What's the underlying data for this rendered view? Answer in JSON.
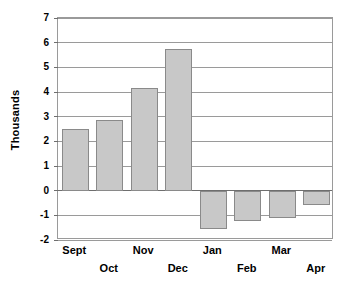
{
  "chart_data": {
    "type": "bar",
    "title": "",
    "xlabel": "",
    "ylabel": "Thousands",
    "categories": [
      "Sept",
      "Oct",
      "Nov",
      "Dec",
      "Jan",
      "Feb",
      "Mar",
      "Apr"
    ],
    "values": [
      2.5,
      2.85,
      4.15,
      5.75,
      -1.55,
      -1.25,
      -1.1,
      -0.6
    ],
    "series": [
      {
        "name": "",
        "values": [
          2.5,
          2.85,
          4.15,
          5.75,
          -1.55,
          -1.25,
          -1.1,
          -0.6
        ]
      }
    ],
    "ylim": [
      -2,
      7
    ],
    "ytick_labels": [
      "7",
      "6",
      "5",
      "4",
      "3",
      "2",
      "1",
      "0",
      "-1",
      "-2"
    ],
    "ytick_values": [
      7,
      6,
      5,
      4,
      3,
      2,
      1,
      0,
      -1,
      -2
    ],
    "grid": true,
    "grid_axis": "y",
    "legend": false,
    "legend_position": "none",
    "bar_fill_color": "#c8c8c8",
    "bar_border_color": "#8a8a8a",
    "grid_color": "#9a9a9a",
    "axis_color": "#6e6e6e",
    "background_color": "#ffffff",
    "text_color": "#000000",
    "xtick_label_rows": [
      0,
      1,
      0,
      1,
      0,
      1,
      0,
      1
    ]
  }
}
